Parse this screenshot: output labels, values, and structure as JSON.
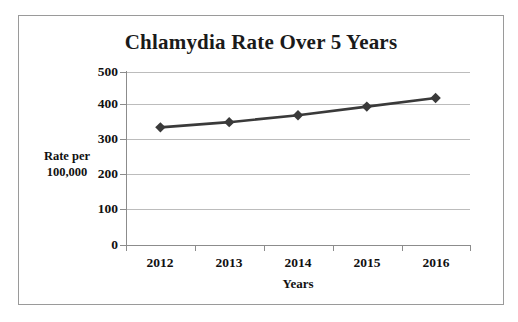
{
  "figure": {
    "background_color": "#ffffff",
    "border_color": "#9a9a9a"
  },
  "chart_data": {
    "type": "line",
    "title": "Chlamydia Rate Over 5 Years",
    "xlabel": "Years",
    "ylabel": "Rate per\n100,000",
    "ylabel_line1": "Rate per",
    "ylabel_line2": "100,000",
    "categories": [
      "2012",
      "2013",
      "2014",
      "2015",
      "2016"
    ],
    "values": [
      340,
      355,
      375,
      400,
      425
    ],
    "series": [
      {
        "name": "Chlamydia Rate",
        "values": [
          340,
          355,
          375,
          400,
          425
        ]
      }
    ],
    "ylim": [
      0,
      500
    ],
    "yticks": [
      0,
      100,
      200,
      300,
      400,
      500
    ],
    "ytick_labels": [
      "0",
      "100",
      "200",
      "300",
      "400",
      "500"
    ],
    "xtick_labels": [
      "2012",
      "2013",
      "2014",
      "2015",
      "2016"
    ],
    "grid": true,
    "grid_axis": "y",
    "grid_color": "#bcbcbc",
    "legend": false,
    "legend_position": "none",
    "line_color": "#3a3a3a",
    "marker": "diamond",
    "marker_color": "#3a3a3a",
    "axis_color": "#8c8c8c"
  }
}
